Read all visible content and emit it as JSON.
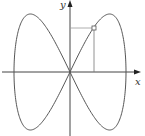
{
  "diagram": {
    "type": "parametric-curve",
    "axes": {
      "x_label": "x",
      "y_label": "y"
    },
    "curve": {
      "shape": "figure-eight",
      "parametric_hint": "x = a·cos(t), y = b·sin(2t)",
      "stroke_color": "#555555"
    },
    "marked_point": {
      "style": "small-open-square",
      "projections": [
        "horizontal line to y-axis",
        "vertical line to x-axis"
      ]
    },
    "colors": {
      "axes": "#444444",
      "curve": "#555555",
      "guide_lines": "#888888",
      "background": "#ffffff"
    }
  }
}
